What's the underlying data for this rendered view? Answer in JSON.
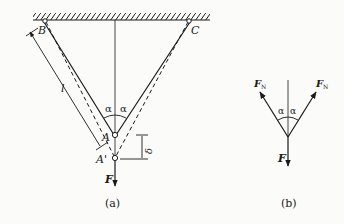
{
  "figure_a": {
    "caption": "(a)",
    "points": {
      "B": "B",
      "C": "C",
      "A": "A",
      "A_prime": "A'"
    },
    "length_label": "l",
    "angle_left": "α",
    "angle_right": "α",
    "displacement_label": "δ",
    "force_label": "F"
  },
  "figure_b": {
    "caption": "(b)",
    "force_left": "F",
    "force_left_sub": "N",
    "force_right": "F",
    "force_right_sub": "N",
    "angle_left": "α",
    "angle_right": "α",
    "force_down": "F"
  },
  "colors": {
    "ink": "#1a1a1a",
    "background": "#fbfbf9"
  }
}
